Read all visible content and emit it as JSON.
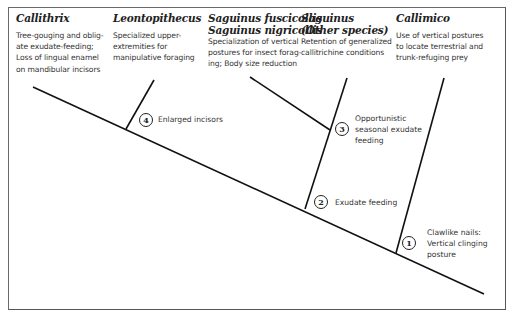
{
  "diagram": {
    "type": "cladogram",
    "taxa": [
      {
        "name": "Callithrix",
        "name2": "",
        "description": "Tree-gouging and oblig-ate exudate-feeding; Loss of lingual enamel on mandibular incisors",
        "lines": [
          "Tree-gouging and oblig-",
          "ate exudate-feeding;",
          "Loss of lingual enamel",
          "on mandibular incisors"
        ]
      },
      {
        "name": "Leontopithecus",
        "name2": "",
        "description": "Specialized upper-extremities for manipulative foraging",
        "lines": [
          "Specialized upper-",
          "extremities for",
          "manipulative foraging"
        ]
      },
      {
        "name": "Saguinus fuscicollis",
        "name2": "Saguinus nigricollis",
        "description": "Specialization of vertical postures for insect forag-ing; Body size reduction",
        "lines": [
          "Specialization of vertical",
          "postures for insect forag-",
          "ing; Body size reduction"
        ]
      },
      {
        "name": "Saguinus",
        "name2": "(Other species)",
        "description": "Retention of generalized callitrichine conditions",
        "lines": [
          "Retention of generalized",
          "callitrichine conditions"
        ]
      },
      {
        "name": "Callimico",
        "name2": "",
        "description": "Use of vertical postures to locate terrestrial and trunk-refuging prey",
        "lines": [
          "Use of vertical postures",
          "to locate terrestrial and",
          "trunk-refuging prey"
        ]
      }
    ],
    "nodes": [
      {
        "number": "1",
        "label_lines": [
          "Clawlike nails:",
          "Vertical clinging",
          "posture"
        ]
      },
      {
        "number": "2",
        "label_lines": [
          "Exudate feeding"
        ]
      },
      {
        "number": "3",
        "label_lines": [
          "Opportunistic",
          "seasonal exudate",
          "feeding"
        ]
      },
      {
        "number": "4",
        "label_lines": [
          "Enlarged incisors"
        ]
      }
    ],
    "colors": {
      "line": "#111111",
      "text": "#333333",
      "frame": "#666666",
      "background": "#ffffff"
    }
  }
}
